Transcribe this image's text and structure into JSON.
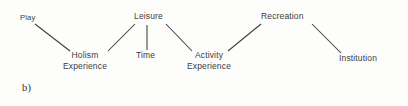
{
  "figure": {
    "label": "b)",
    "background_color": "#fdfdfb",
    "text_color": "#3c3c3c",
    "line_color": "#3c3c3c"
  },
  "diagram": {
    "type": "concept-map",
    "nodes": [
      {
        "id": "play",
        "label": "Play",
        "lines": [
          "Play"
        ],
        "x": 20,
        "y": 12
      },
      {
        "id": "leisure",
        "label": "Leisure",
        "lines": [
          "Leisure"
        ],
        "x": 134,
        "y": 11
      },
      {
        "id": "recreation",
        "label": "Recreation",
        "lines": [
          "Recreation"
        ],
        "x": 261,
        "y": 11
      },
      {
        "id": "holism-experience",
        "label": "Holism Experience",
        "lines": [
          "Holism",
          "Experience"
        ],
        "x": 63,
        "y": 50
      },
      {
        "id": "time",
        "label": "Time",
        "lines": [
          "Time"
        ],
        "x": 136,
        "y": 50
      },
      {
        "id": "activity-experience",
        "label": "Activity Experience",
        "lines": [
          "Activity",
          "Experience"
        ],
        "x": 187,
        "y": 50
      },
      {
        "id": "institution",
        "label": "Institution",
        "lines": [
          "Institution"
        ],
        "x": 339,
        "y": 53
      }
    ],
    "edges": [
      {
        "id": "play-holism",
        "from": "play",
        "to": "holism-experience",
        "x1": 35,
        "y1": 24,
        "x2": 70,
        "y2": 51
      },
      {
        "id": "leisure-holism",
        "from": "leisure",
        "to": "holism-experience",
        "x1": 135,
        "y1": 24,
        "x2": 108,
        "y2": 51
      },
      {
        "id": "leisure-time",
        "from": "leisure",
        "to": "time",
        "x1": 147,
        "y1": 25,
        "x2": 147,
        "y2": 50
      },
      {
        "id": "leisure-activity",
        "from": "leisure",
        "to": "activity-experience",
        "x1": 166,
        "y1": 24,
        "x2": 192,
        "y2": 51
      },
      {
        "id": "recreation-activity",
        "from": "recreation",
        "to": "activity-experience",
        "x1": 261,
        "y1": 24,
        "x2": 228,
        "y2": 51
      },
      {
        "id": "recreation-institution",
        "from": "recreation",
        "to": "institution",
        "x1": 312,
        "y1": 24,
        "x2": 341,
        "y2": 53
      }
    ]
  }
}
